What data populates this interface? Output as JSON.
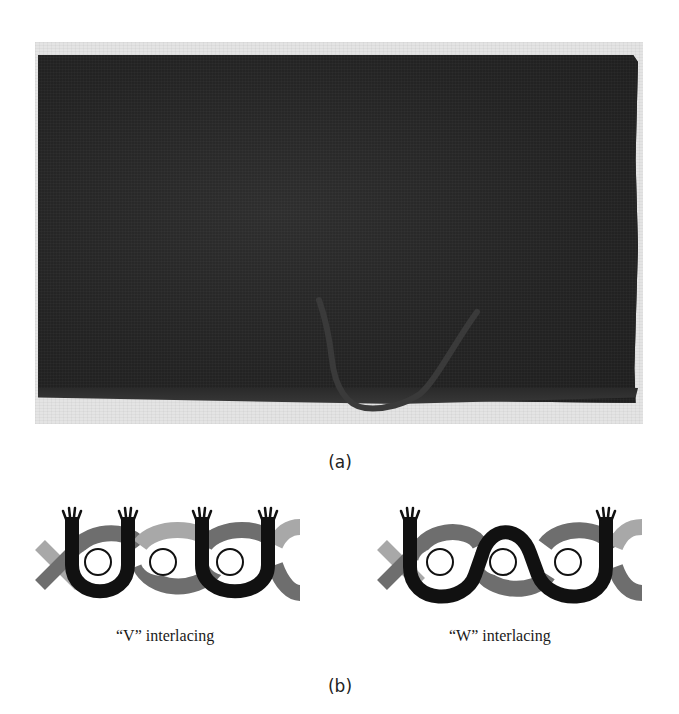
{
  "figure": {
    "panel_a": {
      "label": "(a)",
      "description": "photograph of dark woven textile with a cord hanging from bottom edge"
    },
    "panel_b": {
      "label": "(b)",
      "diagrams": [
        {
          "caption": "“V” interlacing",
          "pattern": "V"
        },
        {
          "caption": "“W” interlacing",
          "pattern": "W"
        }
      ]
    },
    "colors": {
      "strand_black": "#111111",
      "strand_dark_gray": "#6e6e6e",
      "strand_light_gray": "#a8a8a8",
      "fabric": "#252525",
      "photo_background": "#e4e4e4"
    }
  }
}
